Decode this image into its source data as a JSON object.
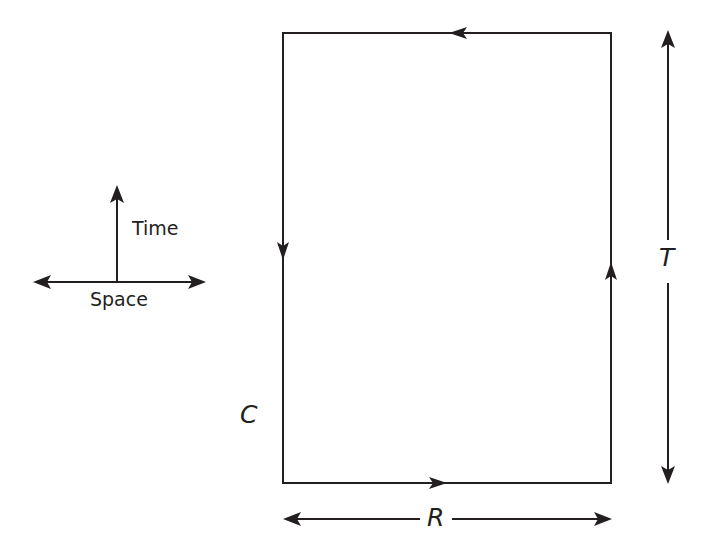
{
  "axes_legend": {
    "vertical_label": "Time",
    "horizontal_label": "Space"
  },
  "loop": {
    "name": "Wilson loop rectangle",
    "label": "C",
    "direction": "clockwise-reversed: up on right side, left along top, down on left side, right along bottom",
    "corners": {
      "left": 283,
      "right": 611,
      "top": 33,
      "bottom": 483
    }
  },
  "dimensions": {
    "width_label": "R",
    "height_label": "T"
  },
  "colors": {
    "line": "#231f20",
    "background": "#ffffff"
  }
}
